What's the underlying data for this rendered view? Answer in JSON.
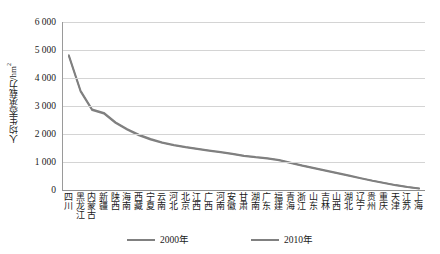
{
  "chart_data": {
    "type": "line",
    "title": "",
    "xlabel": "",
    "ylabel": "人均生态承载力/hm²",
    "ylim": [
      0,
      6000
    ],
    "ytick_labels": [
      "6 000",
      "5 000",
      "4 000",
      "3 000",
      "2 000",
      "1 000",
      "0"
    ],
    "ytick_values": [
      6000,
      5000,
      4000,
      3000,
      2000,
      1000,
      0
    ],
    "grid": true,
    "legend_position": "bottom",
    "categories": [
      "四川",
      "黑龙江",
      "内蒙古",
      "新疆",
      "陕西",
      "海南",
      "西藏",
      "宁夏",
      "云南",
      "河北",
      "北京",
      "江西",
      "广西",
      "河南",
      "安徽",
      "甘肃",
      "湖南",
      "广东",
      "福建",
      "青海",
      "浙江",
      "山东",
      "吉林",
      "山西",
      "湖北",
      "辽宁",
      "贵州",
      "重庆",
      "天津",
      "江苏",
      "上海"
    ],
    "series": [
      {
        "name": "2000年",
        "color": "#808080",
        "values": [
          4820,
          3560,
          2880,
          2760,
          2420,
          2180,
          1980,
          1830,
          1700,
          1610,
          1540,
          1480,
          1420,
          1360,
          1300,
          1230,
          1180,
          1140,
          1080,
          980,
          880,
          790,
          700,
          610,
          520,
          430,
          340,
          260,
          180,
          110,
          60
        ]
      },
      {
        "name": "2010年",
        "color": "#808080",
        "values": [
          4780,
          3520,
          2850,
          2730,
          2390,
          2150,
          1950,
          1800,
          1680,
          1590,
          1520,
          1460,
          1400,
          1340,
          1280,
          1210,
          1160,
          1120,
          1060,
          960,
          860,
          770,
          680,
          590,
          500,
          410,
          325,
          245,
          165,
          100,
          50
        ]
      }
    ]
  },
  "legend": {
    "items": [
      {
        "label": "2000年",
        "color": "#808080"
      },
      {
        "label": "2010年",
        "color": "#808080"
      }
    ]
  }
}
